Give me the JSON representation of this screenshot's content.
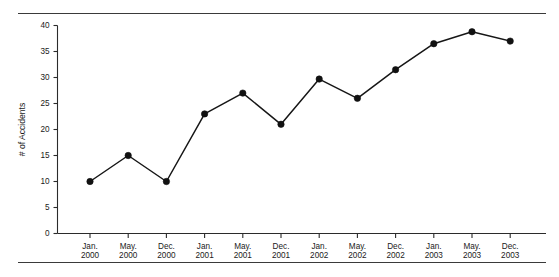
{
  "chart_data": {
    "type": "line",
    "title": "",
    "xlabel": "",
    "ylabel": "# of Accidents",
    "categories": [
      "Jan.\n2000",
      "May.\n2000",
      "Dec.\n2000",
      "Jan.\n2001",
      "May.\n2001",
      "Dec.\n2001",
      "Jan.\n2002",
      "May.\n2002",
      "Dec.\n2002",
      "Jan.\n2003",
      "May.\n2003",
      "Dec.\n2003"
    ],
    "categories_month": [
      "Jan.",
      "May.",
      "Dec.",
      "Jan.",
      "May.",
      "Dec.",
      "Jan.",
      "May.",
      "Dec.",
      "Jan.",
      "May.",
      "Dec."
    ],
    "categories_year": [
      "2000",
      "2000",
      "2000",
      "2001",
      "2001",
      "2001",
      "2002",
      "2002",
      "2002",
      "2003",
      "2003",
      "2003"
    ],
    "values": [
      10,
      15,
      10,
      23,
      27,
      21,
      29.7,
      26,
      31.5,
      36.5,
      38.8,
      37
    ],
    "ylim": [
      0,
      40
    ],
    "yticks": [
      0,
      5,
      10,
      15,
      20,
      25,
      30,
      35,
      40
    ],
    "ytick_labels": [
      "0",
      "5",
      "10",
      "15",
      "20",
      "25",
      "30",
      "35",
      "40"
    ],
    "grid": false,
    "legend": null,
    "marker": "filled-circle",
    "line_color": "#161616",
    "marker_color": "#111111"
  },
  "decorations": {
    "top_rule": "horizontal-rule",
    "bottom_rule": "horizontal-rule"
  }
}
